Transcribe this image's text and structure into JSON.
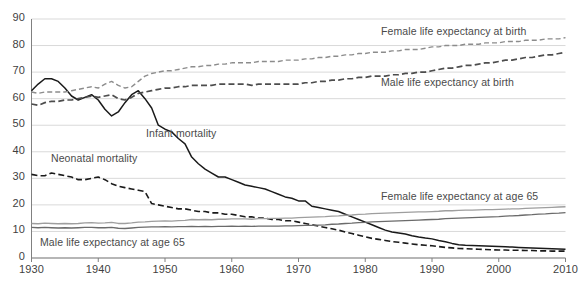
{
  "chart_data": {
    "type": "line",
    "title": "",
    "xlabel": "",
    "ylabel": "",
    "xlim": [
      1930,
      2010
    ],
    "ylim": [
      0,
      90
    ],
    "grid": true,
    "legend_position": "inline-annotations",
    "y_ticks": [
      "0",
      "10",
      "20",
      "30",
      "40",
      "50",
      "60",
      "70",
      "80",
      "90"
    ],
    "x_ticks": [
      "1930",
      "1940",
      "1950",
      "1960",
      "1970",
      "1980",
      "1990",
      "2000",
      "2010"
    ],
    "x": [
      1930,
      1931,
      1932,
      1933,
      1934,
      1935,
      1936,
      1937,
      1938,
      1939,
      1940,
      1941,
      1942,
      1943,
      1944,
      1945,
      1946,
      1947,
      1948,
      1949,
      1950,
      1951,
      1952,
      1953,
      1954,
      1955,
      1956,
      1957,
      1958,
      1959,
      1960,
      1961,
      1962,
      1963,
      1964,
      1965,
      1966,
      1967,
      1968,
      1969,
      1970,
      1971,
      1972,
      1973,
      1974,
      1975,
      1976,
      1977,
      1978,
      1979,
      1980,
      1981,
      1982,
      1983,
      1984,
      1985,
      1986,
      1987,
      1988,
      1989,
      1990,
      1991,
      1992,
      1993,
      1994,
      1995,
      1996,
      1997,
      1998,
      1999,
      2000,
      2001,
      2002,
      2003,
      2004,
      2005,
      2006,
      2007,
      2008,
      2009,
      2010
    ],
    "series": [
      {
        "name": "Infant mortality",
        "style": "solid-black",
        "color": "#1a1a1a",
        "label_x": 146,
        "label_y": 127,
        "values": [
          63.0,
          65.5,
          67.5,
          67.5,
          66.5,
          64.0,
          61.0,
          59.5,
          60.5,
          61.5,
          59.5,
          56.0,
          53.5,
          55.0,
          58.5,
          61.5,
          63.0,
          60.0,
          56.5,
          50.0,
          48.5,
          47.5,
          45.0,
          43.0,
          38.0,
          35.5,
          33.5,
          32.0,
          30.5,
          30.5,
          29.5,
          28.5,
          27.5,
          27.0,
          26.5,
          26.0,
          25.0,
          24.0,
          23.0,
          22.5,
          21.5,
          21.5,
          19.5,
          19.0,
          18.5,
          18.0,
          17.5,
          16.5,
          15.5,
          14.5,
          13.5,
          12.5,
          11.5,
          10.5,
          9.8,
          9.4,
          9.0,
          8.4,
          7.9,
          7.5,
          7.2,
          6.6,
          6.1,
          5.5,
          5.0,
          4.8,
          4.7,
          4.6,
          4.5,
          4.4,
          4.3,
          4.2,
          4.1,
          4.0,
          3.9,
          3.8,
          3.7,
          3.6,
          3.5,
          3.4,
          3.3
        ]
      },
      {
        "name": "Neonatal mortality",
        "style": "dashed-black",
        "color": "#1a1a1a",
        "label_x": 51,
        "label_y": 152,
        "values": [
          31.5,
          31.0,
          31.0,
          32.0,
          31.5,
          31.0,
          30.5,
          29.5,
          29.5,
          30.0,
          30.5,
          29.5,
          28.0,
          27.0,
          26.5,
          26.0,
          25.5,
          25.0,
          20.5,
          20.0,
          19.5,
          19.0,
          18.5,
          18.5,
          18.0,
          17.5,
          17.5,
          17.0,
          17.0,
          16.5,
          16.5,
          16.0,
          15.5,
          15.5,
          15.0,
          15.0,
          14.5,
          14.5,
          14.0,
          14.0,
          13.5,
          13.0,
          12.5,
          12.0,
          11.5,
          11.0,
          10.5,
          9.8,
          9.2,
          8.6,
          8.0,
          7.4,
          7.0,
          6.6,
          6.2,
          5.9,
          5.6,
          5.3,
          5.0,
          4.8,
          4.6,
          4.3,
          4.0,
          3.8,
          3.6,
          3.5,
          3.4,
          3.3,
          3.2,
          3.1,
          3.0,
          3.0,
          2.9,
          2.9,
          2.8,
          2.8,
          2.7,
          2.7,
          2.6,
          2.6,
          2.6
        ]
      },
      {
        "name": "Female life expectancy at birth",
        "style": "dashed-grey",
        "color": "#8c8c8c",
        "label_x": 381,
        "label_y": 25,
        "values": [
          62.5,
          62.0,
          62.5,
          62.5,
          62.5,
          62.5,
          63.0,
          63.5,
          64.0,
          64.5,
          64.0,
          65.5,
          66.5,
          65.0,
          64.0,
          64.5,
          66.5,
          68.5,
          69.5,
          70.0,
          70.5,
          70.5,
          71.0,
          71.5,
          72.0,
          72.0,
          72.5,
          72.5,
          73.0,
          73.0,
          73.5,
          73.5,
          73.5,
          73.5,
          74.0,
          74.0,
          74.0,
          74.0,
          74.5,
          74.5,
          74.5,
          75.0,
          75.0,
          75.5,
          75.5,
          76.0,
          76.0,
          76.5,
          76.5,
          77.0,
          77.0,
          77.5,
          77.5,
          77.5,
          78.0,
          78.0,
          78.5,
          78.5,
          78.5,
          79.0,
          79.5,
          79.5,
          80.0,
          80.0,
          80.0,
          80.5,
          80.5,
          80.5,
          81.0,
          81.0,
          81.0,
          81.5,
          81.5,
          81.5,
          82.0,
          82.0,
          82.0,
          82.5,
          82.5,
          82.5,
          83.0
        ]
      },
      {
        "name": "Male life expectancy at birth",
        "style": "dashed-darkgrey",
        "color": "#4d4d4d",
        "label_x": 381,
        "label_y": 76,
        "values": [
          58.0,
          57.5,
          58.5,
          59.0,
          59.0,
          59.5,
          59.5,
          60.0,
          60.5,
          61.0,
          60.5,
          61.0,
          61.5,
          60.0,
          59.5,
          60.5,
          62.0,
          62.5,
          63.0,
          63.5,
          64.0,
          64.0,
          64.5,
          64.5,
          65.0,
          65.0,
          65.0,
          65.0,
          65.5,
          65.5,
          65.5,
          65.5,
          65.5,
          65.0,
          65.5,
          65.5,
          65.5,
          65.5,
          65.5,
          65.5,
          65.5,
          66.0,
          66.0,
          66.5,
          66.5,
          67.0,
          67.0,
          67.5,
          67.5,
          68.0,
          68.0,
          68.5,
          68.5,
          68.5,
          69.0,
          69.0,
          69.5,
          69.5,
          70.0,
          70.0,
          70.5,
          71.0,
          71.5,
          71.5,
          72.0,
          72.5,
          72.5,
          73.0,
          73.5,
          73.5,
          74.0,
          74.5,
          74.5,
          75.0,
          75.5,
          75.5,
          76.0,
          76.5,
          76.5,
          77.0,
          77.5
        ]
      },
      {
        "name": "Female life expectancy at age 65",
        "style": "solid-lightgrey",
        "color": "#9e9e9e",
        "label_x": 381,
        "label_y": 190,
        "values": [
          13.0,
          12.9,
          13.1,
          13.0,
          12.9,
          13.0,
          12.9,
          13.0,
          13.2,
          13.3,
          13.1,
          13.2,
          13.4,
          13.0,
          13.0,
          13.2,
          13.5,
          13.6,
          13.8,
          13.9,
          14.0,
          13.9,
          14.1,
          14.2,
          14.5,
          14.4,
          14.5,
          14.4,
          14.6,
          14.6,
          14.7,
          14.7,
          14.7,
          14.6,
          14.8,
          14.8,
          14.9,
          14.9,
          15.0,
          15.0,
          15.2,
          15.3,
          15.4,
          15.5,
          15.6,
          15.8,
          15.9,
          16.1,
          16.2,
          16.4,
          16.5,
          16.7,
          16.8,
          16.9,
          17.0,
          17.1,
          17.2,
          17.3,
          17.4,
          17.4,
          17.5,
          17.6,
          17.8,
          17.8,
          17.9,
          18.0,
          18.0,
          18.1,
          18.2,
          18.2,
          18.3,
          18.4,
          18.5,
          18.5,
          18.7,
          18.8,
          18.9,
          19.0,
          19.1,
          19.2,
          19.3
        ]
      },
      {
        "name": "Male life expectancy at age 65",
        "style": "solid-darkgrey",
        "color": "#6b6b6b",
        "label_x": 40,
        "label_y": 236,
        "values": [
          11.5,
          11.4,
          11.5,
          11.4,
          11.3,
          11.4,
          11.3,
          11.4,
          11.5,
          11.5,
          11.4,
          11.4,
          11.5,
          11.2,
          11.1,
          11.3,
          11.5,
          11.6,
          11.7,
          11.7,
          11.8,
          11.7,
          11.8,
          11.8,
          11.9,
          11.8,
          11.9,
          11.8,
          11.9,
          11.9,
          12.0,
          11.9,
          12.0,
          11.9,
          12.0,
          12.0,
          12.0,
          12.0,
          12.1,
          12.1,
          12.2,
          12.3,
          12.3,
          12.4,
          12.5,
          12.7,
          12.8,
          13.0,
          13.1,
          13.3,
          13.4,
          13.6,
          13.7,
          13.8,
          13.9,
          14.0,
          14.1,
          14.2,
          14.3,
          14.4,
          14.5,
          14.6,
          14.8,
          14.9,
          15.0,
          15.1,
          15.2,
          15.3,
          15.4,
          15.5,
          15.6,
          15.8,
          15.9,
          16.0,
          16.2,
          16.3,
          16.5,
          16.6,
          16.8,
          16.9,
          17.1
        ]
      }
    ],
    "footnote": "",
    "axis_color": "#808080",
    "grid_color": "#d9d9d9"
  }
}
